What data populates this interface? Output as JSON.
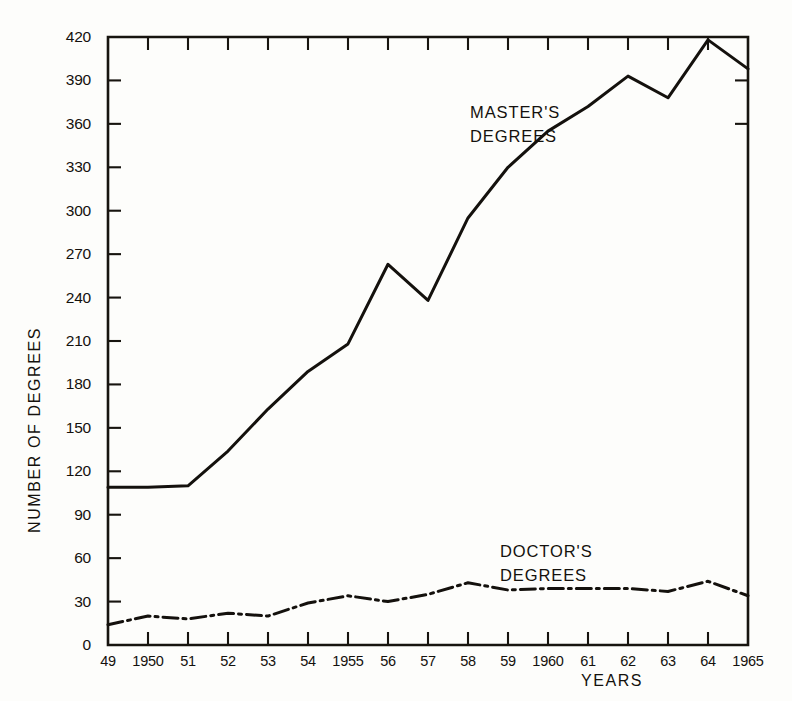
{
  "chart_data": {
    "type": "line",
    "title": "",
    "xlabel": "YEARS",
    "ylabel": "NUMBER OF DEGREES",
    "xlim": [
      1949,
      1965
    ],
    "ylim": [
      0,
      420
    ],
    "grid": false,
    "legend_position": "inline-annotation",
    "x": [
      1949,
      1950,
      1951,
      1952,
      1953,
      1954,
      1955,
      1956,
      1957,
      1958,
      1959,
      1960,
      1961,
      1962,
      1963,
      1964,
      1965
    ],
    "categories": [
      "49",
      "1950",
      "51",
      "52",
      "53",
      "54",
      "1955",
      "56",
      "57",
      "58",
      "59",
      "1960",
      "61",
      "62",
      "63",
      "64",
      "1965"
    ],
    "x_tick_labels": [
      "49",
      "1950",
      "51",
      "52",
      "53",
      "54",
      "1955",
      "56",
      "57",
      "58",
      "59",
      "1960",
      "61",
      "62",
      "63",
      "64",
      "1965"
    ],
    "y_tick_labels": [
      "0",
      "30",
      "60",
      "90",
      "120",
      "150",
      "180",
      "210",
      "240",
      "270",
      "300",
      "330",
      "360",
      "390",
      "420"
    ],
    "y_ticks": [
      0,
      30,
      60,
      90,
      120,
      150,
      180,
      210,
      240,
      270,
      300,
      330,
      360,
      390,
      420
    ],
    "series": [
      {
        "name": "MASTER'S DEGREES",
        "annotation_lines": [
          "MASTER'S",
          "DEGREES"
        ],
        "style": "solid",
        "values": [
          109,
          109,
          110,
          134,
          163,
          189,
          208,
          263,
          238,
          295,
          330,
          355,
          372,
          393,
          378,
          418,
          398
        ]
      },
      {
        "name": "DOCTOR'S DEGREES",
        "annotation_lines": [
          "DOCTOR'S",
          "DEGREES"
        ],
        "style": "dash-dot",
        "values": [
          14,
          20,
          18,
          22,
          20,
          29,
          34,
          30,
          35,
          43,
          38,
          39,
          39,
          39,
          37,
          44,
          34
        ]
      }
    ]
  },
  "colors": {
    "ink": "#14110d",
    "paper": "#fdfdfb"
  }
}
